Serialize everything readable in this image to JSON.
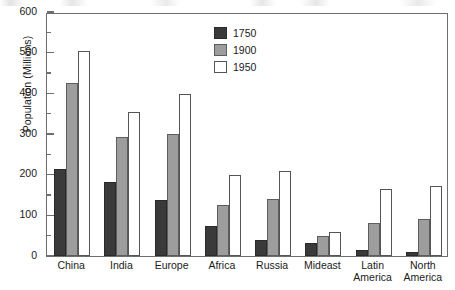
{
  "chart_data": {
    "type": "bar",
    "title": "",
    "xlabel": "",
    "ylabel": "Population (Millions)",
    "ylim": [
      0,
      600
    ],
    "ytick_step": 100,
    "yminor_step": 50,
    "grid": false,
    "legend_position": "top-center",
    "ytick_labels": [
      "0",
      "100",
      "200",
      "300",
      "400",
      "500",
      "600"
    ],
    "categories": [
      "China",
      "India",
      "Europe",
      "Africa",
      "Russia",
      "Mideast",
      "Latin\nAmerica",
      "North\nAmerica"
    ],
    "series": [
      {
        "name": "1750",
        "color": "#3a3a3a",
        "values": [
          215,
          183,
          137,
          75,
          40,
          33,
          15,
          11
        ]
      },
      {
        "name": "1900",
        "color": "#9d9d9d",
        "values": [
          425,
          292,
          300,
          126,
          141,
          50,
          80,
          90
        ]
      },
      {
        "name": "1950",
        "color": "#ffffff",
        "values": [
          503,
          353,
          398,
          200,
          209,
          60,
          165,
          172
        ]
      }
    ]
  },
  "legend": {
    "entries": [
      {
        "label": "1750"
      },
      {
        "label": "1900"
      },
      {
        "label": "1950"
      }
    ]
  },
  "axes": {
    "y_axis_title": "Population (Millions)"
  }
}
